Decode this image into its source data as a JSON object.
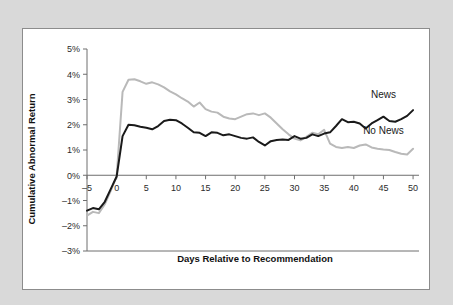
{
  "figure": {
    "background_color": "#d9d9d9",
    "panel_color": "#ffffff",
    "border_color": "#8c8c8c"
  },
  "chart_data": {
    "type": "line",
    "title": "",
    "xlabel": "Days Relative to Recommendation",
    "ylabel": "Cumulative Abnormal Return",
    "xlim": [
      -5,
      51
    ],
    "ylim": [
      -3,
      5
    ],
    "grid": false,
    "legend_position": "inline-right",
    "xticks": [
      -5,
      0,
      5,
      10,
      15,
      20,
      25,
      30,
      35,
      40,
      45,
      50
    ],
    "xtick_labels": [
      "–5",
      "0",
      "5",
      "10",
      "15",
      "20",
      "25",
      "30",
      "35",
      "40",
      "45",
      "50"
    ],
    "yticks": [
      5,
      4,
      3,
      2,
      1,
      0,
      -1,
      -2,
      -3
    ],
    "ytick_labels": [
      "5%",
      "4%",
      "3%",
      "2%",
      "1%",
      "0%",
      "–1%",
      "–2%",
      "–3%"
    ],
    "x": [
      -5,
      -4,
      -3,
      -2,
      -1,
      0,
      1,
      2,
      3,
      4,
      5,
      6,
      7,
      8,
      9,
      10,
      11,
      12,
      13,
      14,
      15,
      16,
      17,
      18,
      19,
      20,
      21,
      22,
      23,
      24,
      25,
      26,
      27,
      28,
      29,
      30,
      31,
      32,
      33,
      34,
      35,
      36,
      37,
      38,
      39,
      40,
      41,
      42,
      43,
      44,
      45,
      46,
      47,
      48,
      49,
      50
    ],
    "series": [
      {
        "name": "News",
        "color": "#1a1a1a",
        "label": "News",
        "label_x": 45,
        "label_y": 3.05,
        "values": [
          -1.4,
          -1.3,
          -1.35,
          -1.05,
          -0.55,
          -0.05,
          1.55,
          2.0,
          1.98,
          1.92,
          1.88,
          1.82,
          1.95,
          2.15,
          2.2,
          2.18,
          2.05,
          1.88,
          1.7,
          1.68,
          1.55,
          1.7,
          1.68,
          1.58,
          1.62,
          1.55,
          1.48,
          1.45,
          1.5,
          1.32,
          1.18,
          1.35,
          1.4,
          1.42,
          1.4,
          1.55,
          1.45,
          1.48,
          1.62,
          1.55,
          1.65,
          1.7,
          1.95,
          2.22,
          2.1,
          2.12,
          2.05,
          1.85,
          2.05,
          2.18,
          2.32,
          2.15,
          2.12,
          2.22,
          2.35,
          2.58
        ]
      },
      {
        "name": "No News",
        "color": "#b9b9b9",
        "label": "No News",
        "label_x": 45,
        "label_y": 1.62,
        "values": [
          -1.6,
          -1.45,
          -1.5,
          -1.15,
          -0.62,
          -0.05,
          3.3,
          3.78,
          3.8,
          3.72,
          3.62,
          3.68,
          3.6,
          3.48,
          3.32,
          3.2,
          3.05,
          2.92,
          2.72,
          2.88,
          2.62,
          2.52,
          2.48,
          2.32,
          2.25,
          2.22,
          2.32,
          2.42,
          2.45,
          2.38,
          2.45,
          2.28,
          2.05,
          1.82,
          1.62,
          1.45,
          1.38,
          1.52,
          1.68,
          1.62,
          1.8,
          1.25,
          1.12,
          1.08,
          1.12,
          1.08,
          1.18,
          1.22,
          1.1,
          1.05,
          1.02,
          1.0,
          0.92,
          0.85,
          0.82,
          1.05
        ]
      }
    ]
  }
}
